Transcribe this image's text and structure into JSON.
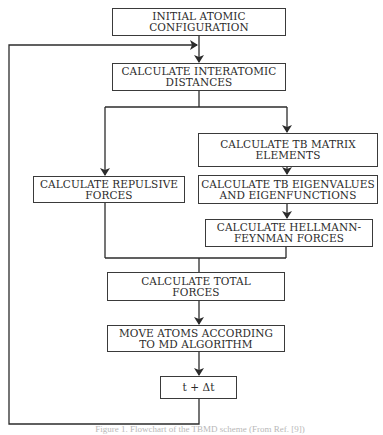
{
  "diagram": {
    "type": "flowchart",
    "nodes": [
      {
        "id": "initial",
        "label": "INITIAL ATOMIC\nCONFIGURATION"
      },
      {
        "id": "distances",
        "label": "CALCULATE INTERATOMIC\nDISTANCES"
      },
      {
        "id": "tb_matrix",
        "label": "CALCULATE TB MATRIX\nELEMENTS"
      },
      {
        "id": "repulsive",
        "label": "CALCULATE REPULSIVE\nFORCES"
      },
      {
        "id": "eigen",
        "label": "CALCULATE TB EIGENVALUES\nAND EIGENFUNCTIONS"
      },
      {
        "id": "hellmann",
        "label": "CALCULATE HELLMANN-\nFEYNMAN FORCES"
      },
      {
        "id": "total",
        "label": "CALCULATE TOTAL\nFORCES"
      },
      {
        "id": "move",
        "label": "MOVE ATOMS ACCORDING\nTO MD ALGORITHM"
      },
      {
        "id": "timestep",
        "label": "t + Δt"
      }
    ],
    "edges": [
      {
        "from": "initial",
        "to": "distances"
      },
      {
        "from": "distances",
        "to": "tb_matrix"
      },
      {
        "from": "distances",
        "to": "repulsive"
      },
      {
        "from": "tb_matrix",
        "to": "eigen"
      },
      {
        "from": "eigen",
        "to": "hellmann"
      },
      {
        "from": "repulsive",
        "to": "total"
      },
      {
        "from": "hellmann",
        "to": "total"
      },
      {
        "from": "total",
        "to": "move"
      },
      {
        "from": "move",
        "to": "timestep"
      },
      {
        "from": "timestep",
        "to": "distances",
        "note": "loop back"
      }
    ]
  },
  "caption": "Figure 1. Flowchart of the TBMD scheme (From Ref. [9])"
}
